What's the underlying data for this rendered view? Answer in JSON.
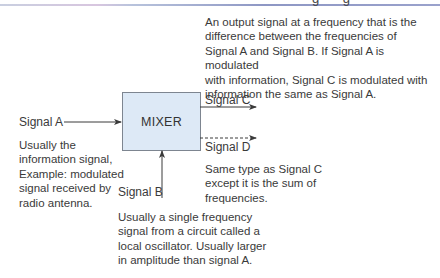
{
  "header": {
    "heading_fragment": "g g"
  },
  "diagram": {
    "block": {
      "label": "MIXER",
      "fill_color": "#dde9f6",
      "border_color": "#7d8590"
    },
    "inputs": [
      {
        "name": "Signal A",
        "direction": "into-left",
        "description": "Usually the\ninformation signal,\nExample: modulated\nsignal received by\nradio antenna."
      },
      {
        "name": "Signal B",
        "direction": "into-bottom",
        "description": "Usually a single frequency\nsignal from a circuit called a\nlocal oscillator. Usually larger\nin amplitude than signal A."
      }
    ],
    "outputs": [
      {
        "name": "Signal C",
        "line_style": "solid",
        "description": "An output signal at a frequency that is the\ndifference between the frequencies of\nSignal A and Signal B. If Signal A is modulated\nwith information, Signal C is modulated with\ninformation the same as Signal A."
      },
      {
        "name": "Signal D",
        "line_style": "dashed",
        "description": "Same type as Signal C\nexcept it is the sum of\nfrequencies."
      }
    ],
    "line_color": "#3a3a3a"
  }
}
